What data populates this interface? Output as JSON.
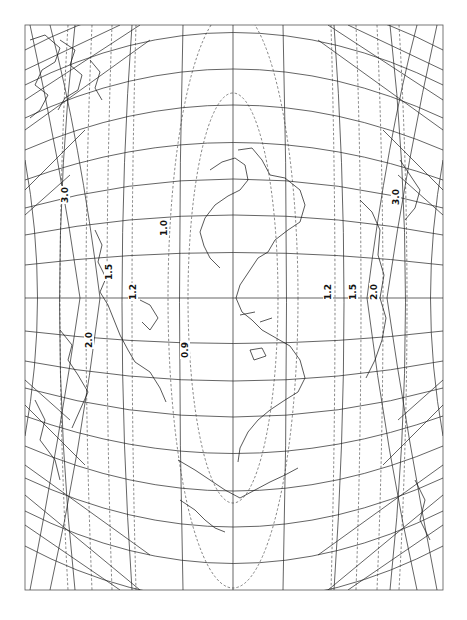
{
  "map": {
    "type": "map projection with distortion isolines",
    "orientation": "rotated 90 degrees clockwise",
    "frame": {
      "x": 25,
      "y": 25,
      "width": 418,
      "height": 565
    },
    "central_meridian_x": 233,
    "equator_y": 298,
    "colors": {
      "grid": "#222222",
      "contour": "#333333",
      "coast": "#111111",
      "background": "#ffffff"
    }
  },
  "contour_labels": {
    "upper": [
      {
        "id": "l30a",
        "text": "3.0",
        "x": 68,
        "y": 195
      },
      {
        "id": "l20a",
        "text": "2.0",
        "x": 92,
        "y": 340
      },
      {
        "id": "l15a",
        "text": "1.5",
        "x": 112,
        "y": 272
      },
      {
        "id": "l12a",
        "text": "1.2",
        "x": 136,
        "y": 292
      },
      {
        "id": "l10a",
        "text": "1.0",
        "x": 167,
        "y": 228
      },
      {
        "id": "l09a",
        "text": "0.9",
        "x": 188,
        "y": 350
      }
    ],
    "lower": [
      {
        "id": "l12b",
        "text": "1.2",
        "x": 331,
        "y": 292
      },
      {
        "id": "l15b",
        "text": "1.5",
        "x": 356,
        "y": 292
      },
      {
        "id": "l20b",
        "text": "2.0",
        "x": 377,
        "y": 292
      },
      {
        "id": "l30b",
        "text": "3.0",
        "x": 399,
        "y": 197
      }
    ]
  },
  "labels": {
    "l30a": "3.0",
    "l20a": "2.0",
    "l15a": "1.5",
    "l12a": "1.2",
    "l10a": "1.0",
    "l09a": "0.9",
    "l12b": "1.2",
    "l15b": "1.5",
    "l20b": "2.0",
    "l30b": "3.0"
  }
}
